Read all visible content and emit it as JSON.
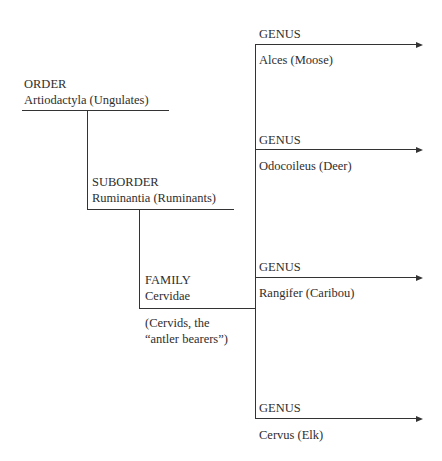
{
  "diagram": {
    "order": {
      "rank": "ORDER",
      "name": "Artiodactyla (Ungulates)"
    },
    "suborder": {
      "rank": "SUBORDER",
      "name": "Ruminantia (Ruminants)"
    },
    "family": {
      "rank": "FAMILY",
      "name": "Cervidae",
      "note_line1": "(Cervids, the",
      "note_line2": "“antler bearers”)"
    },
    "genera": [
      {
        "rank": "GENUS",
        "name": "Alces (Moose)"
      },
      {
        "rank": "GENUS",
        "name": "Odocoileus (Deer)"
      },
      {
        "rank": "GENUS",
        "name": "Rangifer (Caribou)"
      },
      {
        "rank": "GENUS",
        "name": "Cervus (Elk)"
      }
    ]
  }
}
